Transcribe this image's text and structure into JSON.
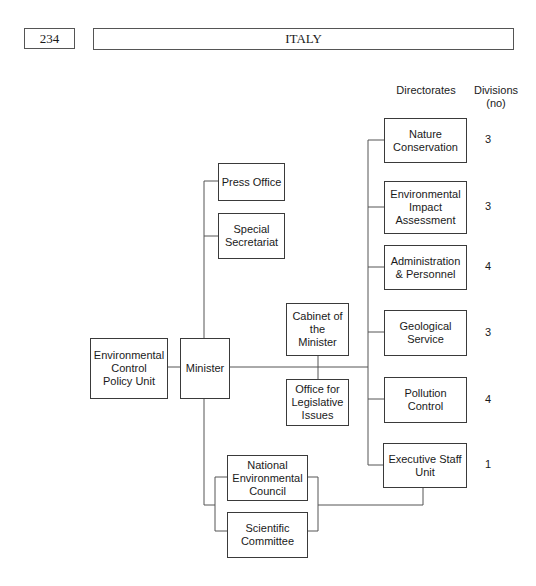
{
  "header": {
    "page_number": "234",
    "title": "ITALY"
  },
  "columns": {
    "directorates": "Directorates",
    "divisions": "Divisions\n(no)"
  },
  "nodes": {
    "ecpu": "Environmental\nControl\nPolicy Unit",
    "minister": "Minister",
    "press_office": "Press Office",
    "special_secretariat": "Special\nSecretariat",
    "cabinet": "Cabinet of\nthe\nMinister",
    "legislative": "Office for\nLegislative\nIssues",
    "nec": "National\nEnvironmental\nCouncil",
    "scientific": "Scientific\nCommittee"
  },
  "directorates": [
    {
      "name": "Nature\nConservation",
      "divisions": "3"
    },
    {
      "name": "Environmental\nImpact\nAssessment",
      "divisions": "3"
    },
    {
      "name": "Administration\n& Personnel",
      "divisions": "4"
    },
    {
      "name": "Geological\nService",
      "divisions": "3"
    },
    {
      "name": "Pollution\nControl",
      "divisions": "4"
    },
    {
      "name": "Executive Staff\nUnit",
      "divisions": "1"
    }
  ]
}
